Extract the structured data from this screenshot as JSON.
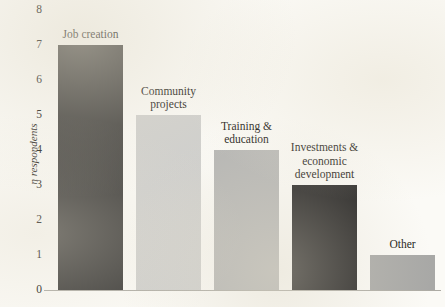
{
  "chart_data": {
    "type": "bar",
    "title": "",
    "xlabel": "",
    "ylabel": "n respondents",
    "ylim": [
      0,
      8
    ],
    "yticks": [
      "0",
      "1",
      "2",
      "3",
      "4",
      "5",
      "6",
      "7",
      "8"
    ],
    "grid": false,
    "legend": "none",
    "categories": [
      "Job creation",
      "Community projects",
      "Training & education",
      "Investments & economic development",
      "Other"
    ],
    "values": [
      7,
      5,
      4,
      3,
      1
    ],
    "bars": [
      {
        "label": "Job creation",
        "label_lines": "Job creation",
        "value": 7,
        "color": "#3c3b39"
      },
      {
        "label": "Community projects",
        "label_lines": "Community\nprojects",
        "value": 5,
        "color": "#cfcfcd"
      },
      {
        "label": "Training & education",
        "label_lines": "Training &\neducation",
        "value": 4,
        "color": "#b6b6b4"
      },
      {
        "label": "Investments & economic development",
        "label_lines": "Investments &\neconomic\ndevelopment",
        "value": 3,
        "color": "#232222"
      },
      {
        "label": "Other",
        "label_lines": "Other",
        "value": 1,
        "color": "#a8a8a6"
      }
    ]
  },
  "axis": {
    "baseline_color": "#6e6a60"
  }
}
